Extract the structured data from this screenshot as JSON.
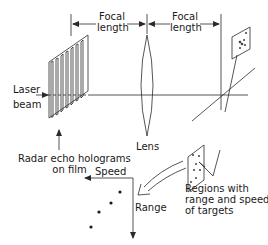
{
  "figure": {
    "labels": {
      "focal_length_1": [
        "Focal",
        "length"
      ],
      "focal_length_2": [
        "Focal",
        "length"
      ],
      "laser_beam": [
        "Laser",
        "beam"
      ],
      "lens": "Lens",
      "holograms": [
        "Radar echo holograms",
        "on film"
      ],
      "regions": [
        "Regions with",
        "range and speed",
        "of targets"
      ],
      "speed_axis": "Speed",
      "range_axis": "Range"
    },
    "colors": {
      "line": "#2a2a2a",
      "background": "#ffffff"
    },
    "components": [
      "laser-beam",
      "radar-echo-hologram-film",
      "lens",
      "output-plane",
      "target-region-plate",
      "speed-range-plot"
    ]
  }
}
